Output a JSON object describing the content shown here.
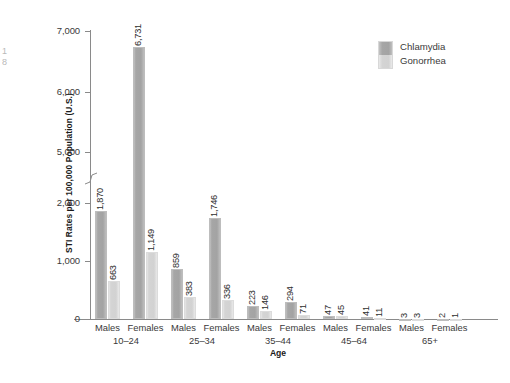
{
  "chart_data": {
    "type": "bar",
    "title": "",
    "xlabel": "Age",
    "ylabel": "STI Rates per 100,000 Population (U.S.)",
    "categories": [
      "Males 10–24",
      "Females 10–24",
      "Males 25–34",
      "Females 25–34",
      "Males 35–44",
      "Females 35–44",
      "Males 45–64",
      "Females 45–64",
      "Males 65+",
      "Females 65+"
    ],
    "groups": [
      {
        "age": "10–24",
        "sexes": [
          "Males",
          "Females"
        ]
      },
      {
        "age": "25–34",
        "sexes": [
          "Males",
          "Females"
        ]
      },
      {
        "age": "35–44",
        "sexes": [
          "Males",
          "Females"
        ]
      },
      {
        "age": "45–64",
        "sexes": [
          "Males",
          "Females"
        ]
      },
      {
        "age": "65+",
        "sexes": [
          "Males",
          "Females"
        ]
      }
    ],
    "series": [
      {
        "name": "Chlamydia",
        "color": "#a6a6a6",
        "values": [
          1870,
          6731,
          859,
          1746,
          223,
          294,
          47,
          41,
          3,
          2
        ],
        "labels": [
          "1,870",
          "6,731",
          "859",
          "1,746",
          "223",
          "294",
          "47",
          "41",
          "3",
          "2"
        ]
      },
      {
        "name": "Gonorrhea",
        "color": "#d4d4d4",
        "values": [
          663,
          1149,
          383,
          336,
          146,
          71,
          45,
          11,
          3,
          1
        ],
        "labels": [
          "663",
          "1,149",
          "383",
          "336",
          "146",
          "71",
          "45",
          "11",
          "3",
          "1"
        ]
      }
    ],
    "yaxis": {
      "ticks": [
        0,
        1000,
        2000,
        5000,
        6000,
        7000
      ],
      "tick_labels": [
        "0",
        "1,000",
        "2,000",
        "5,000",
        "6,000",
        "7,000"
      ],
      "axis_break": true,
      "axis_break_between": [
        2000,
        5000
      ],
      "ylim": [
        0,
        7000
      ]
    },
    "grid": false,
    "legend_position": "top-right"
  },
  "legend": {
    "entries": [
      {
        "label": "Chlamydia"
      },
      {
        "label": "Gonorrhea"
      }
    ]
  },
  "axes": {
    "y_title": "STI Rates per 100,000 Population (U.S.)",
    "x_title": "Age"
  },
  "artifacts": {
    "left_edge_fragment": "1\n8"
  }
}
